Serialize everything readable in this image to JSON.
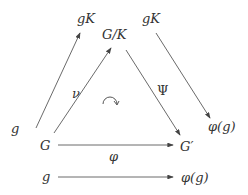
{
  "nodes": {
    "gK_left": "gK",
    "GK_top": "G/K",
    "gK_right": "gK",
    "g_left": "g",
    "G": "G",
    "Gprime": "G′",
    "phig_right": "φ(g)",
    "g_bottom": "g",
    "phig_bottom": "φ(g)"
  },
  "edges": {
    "nu": "ν",
    "Psi": "Ψ",
    "phi": "φ",
    "commute": "↷"
  },
  "colors": {
    "stroke": "#444444",
    "text": "#333333"
  }
}
